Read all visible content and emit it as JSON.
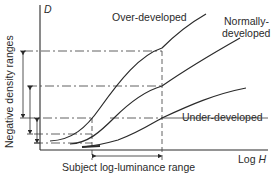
{
  "figure": {
    "y_axis_symbol": "D",
    "x_axis_label_prefix": "Log ",
    "x_axis_symbol": "H",
    "y_axis_label": "Negative density ranges",
    "x_range_label": "Subject log-luminance range",
    "curves": [
      {
        "name": "over-developed",
        "label": "Over-developed"
      },
      {
        "name": "normally-developed",
        "label_line1": "Normally-",
        "label_line2": "developed"
      },
      {
        "name": "under-developed",
        "label": "Under-developed"
      }
    ]
  },
  "colors": {
    "ink": "#2a2a2a",
    "background": "#ffffff"
  }
}
